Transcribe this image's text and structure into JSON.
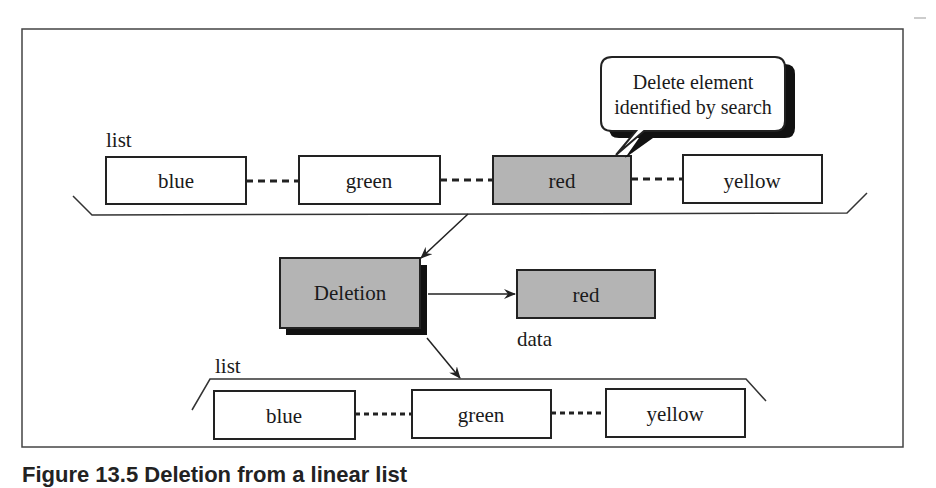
{
  "diagram": {
    "top_list": {
      "label": "list",
      "nodes": [
        {
          "value": "blue",
          "highlighted": false
        },
        {
          "value": "green",
          "highlighted": false
        },
        {
          "value": "red",
          "highlighted": true
        },
        {
          "value": "yellow",
          "highlighted": false
        }
      ]
    },
    "callout": {
      "line1": "Delete element",
      "line2": "identified by search"
    },
    "operation": {
      "label": "Deletion"
    },
    "output_data": {
      "value": "red",
      "label": "data"
    },
    "bottom_list": {
      "label": "list",
      "nodes": [
        {
          "value": "blue"
        },
        {
          "value": "green"
        },
        {
          "value": "yellow"
        }
      ]
    },
    "colors": {
      "highlight_fill": "#b4b4b4",
      "stroke": "#222222",
      "shadow": "#111111"
    }
  },
  "caption": {
    "text": "Figure 13.5  Deletion from a linear list"
  }
}
